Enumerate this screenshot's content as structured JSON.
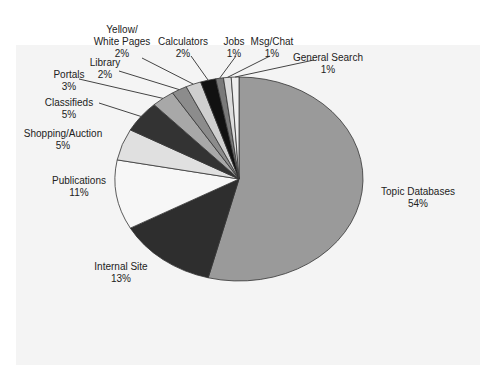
{
  "chart_data": {
    "type": "pie",
    "title": "",
    "categories": [
      "Topic Databases",
      "Internal Site",
      "Publications",
      "Shopping/Auction",
      "Classifieds",
      "Portals",
      "Library",
      "Yellow/ White Pages",
      "Calculators",
      "Jobs",
      "Msg/Chat",
      "General Search"
    ],
    "values": [
      54,
      13,
      11,
      5,
      5,
      3,
      2,
      2,
      2,
      1,
      1,
      1
    ],
    "unit": "%",
    "colors": [
      "#9a9a9a",
      "#2e2e2e",
      "#f7f7f7",
      "#e0e0e0",
      "#333333",
      "#a8a8a8",
      "#8c8c8c",
      "#cfcfcf",
      "#111111",
      "#7a7a7a",
      "#dcdcdc",
      "#eeeeee"
    ],
    "start_angle_deg": 0,
    "direction": "clockwise",
    "legend": "none",
    "data_labels": "category and percent with leader lines"
  },
  "labels": [
    {
      "name": "Topic Databases",
      "pct": "54%",
      "x": 418,
      "y": 186
    },
    {
      "name": "Internal Site",
      "pct": "13%",
      "x": 121,
      "y": 261
    },
    {
      "name": "Publications",
      "pct": "11%",
      "x": 79,
      "y": 175
    },
    {
      "name": "Shopping/Auction",
      "pct": "5%",
      "x": 63,
      "y": 128
    },
    {
      "name": "Classifieds",
      "pct": "5%",
      "x": 69,
      "y": 97
    },
    {
      "name": "Portals",
      "pct": "3%",
      "x": 69,
      "y": 69
    },
    {
      "name": "Library",
      "pct": "2%",
      "x": 105,
      "y": 57
    },
    {
      "name": "Yellow/",
      "name2": "White Pages",
      "pct": "2%",
      "x": 122,
      "y": 24
    },
    {
      "name": "Calculators",
      "pct": "2%",
      "x": 183,
      "y": 36
    },
    {
      "name": "Jobs",
      "pct": "1%",
      "x": 234,
      "y": 36
    },
    {
      "name": "Msg/Chat",
      "pct": "1%",
      "x": 272,
      "y": 36
    },
    {
      "name": "General Search",
      "pct": "1%",
      "x": 328,
      "y": 52
    }
  ]
}
